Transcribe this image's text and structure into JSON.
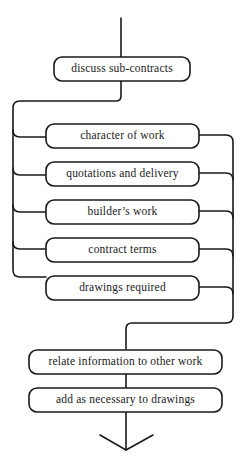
{
  "diagram": {
    "type": "flowchart",
    "colors": {
      "stroke": "#1a1a1a",
      "background": "#ffffff"
    },
    "start_node": {
      "id": "n0",
      "label": "discuss sub-contracts"
    },
    "parallel_nodes": [
      {
        "id": "n1",
        "label": "character of work"
      },
      {
        "id": "n2",
        "label": "quotations and delivery"
      },
      {
        "id": "n3",
        "label": "builder’s work"
      },
      {
        "id": "n4",
        "label": "contract terms"
      },
      {
        "id": "n5",
        "label": "drawings required"
      }
    ],
    "sequential_nodes": [
      {
        "id": "n6",
        "label": "relate information to other work"
      },
      {
        "id": "n7",
        "label": "add as necessary to drawings"
      }
    ],
    "end_marker": "arrow-down"
  }
}
